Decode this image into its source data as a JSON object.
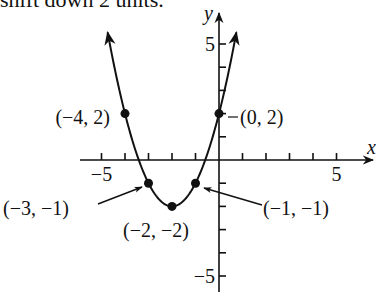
{
  "caption": "shift down 2 units.",
  "chart_data": {
    "type": "line",
    "title": "",
    "function": "y = (x + 2)^2 - 2",
    "xlabel": "x",
    "ylabel": "y",
    "xlim": [
      -6,
      6.3
    ],
    "ylim": [
      -5.7,
      6.3
    ],
    "x_ticks": [
      -5,
      -4,
      -3,
      -2,
      -1,
      1,
      2,
      3,
      4,
      5
    ],
    "y_ticks": [
      -5,
      -4,
      -3,
      -2,
      -1,
      1,
      2,
      3,
      4,
      5
    ],
    "x_tick_labels": [
      {
        "value": -5,
        "text": "−5"
      },
      {
        "value": 5,
        "text": "5"
      }
    ],
    "y_tick_labels": [
      {
        "value": 5,
        "text": "5"
      },
      {
        "value": -5,
        "text": "−5"
      }
    ],
    "grid": false,
    "series": [
      {
        "name": "parabola",
        "x": [
          -4,
          -3,
          -2,
          -1,
          0
        ],
        "y": [
          2,
          -1,
          -2,
          -1,
          2
        ]
      }
    ],
    "points": [
      {
        "x": -4,
        "y": 2,
        "label": "(−4, 2)"
      },
      {
        "x": 0,
        "y": 2,
        "label": "(0, 2)"
      },
      {
        "x": -3,
        "y": -1,
        "label": "(−3, −1)"
      },
      {
        "x": -2,
        "y": -2,
        "label": "(−2, −2)"
      },
      {
        "x": -1,
        "y": -1,
        "label": "(−1, −1)"
      }
    ]
  }
}
